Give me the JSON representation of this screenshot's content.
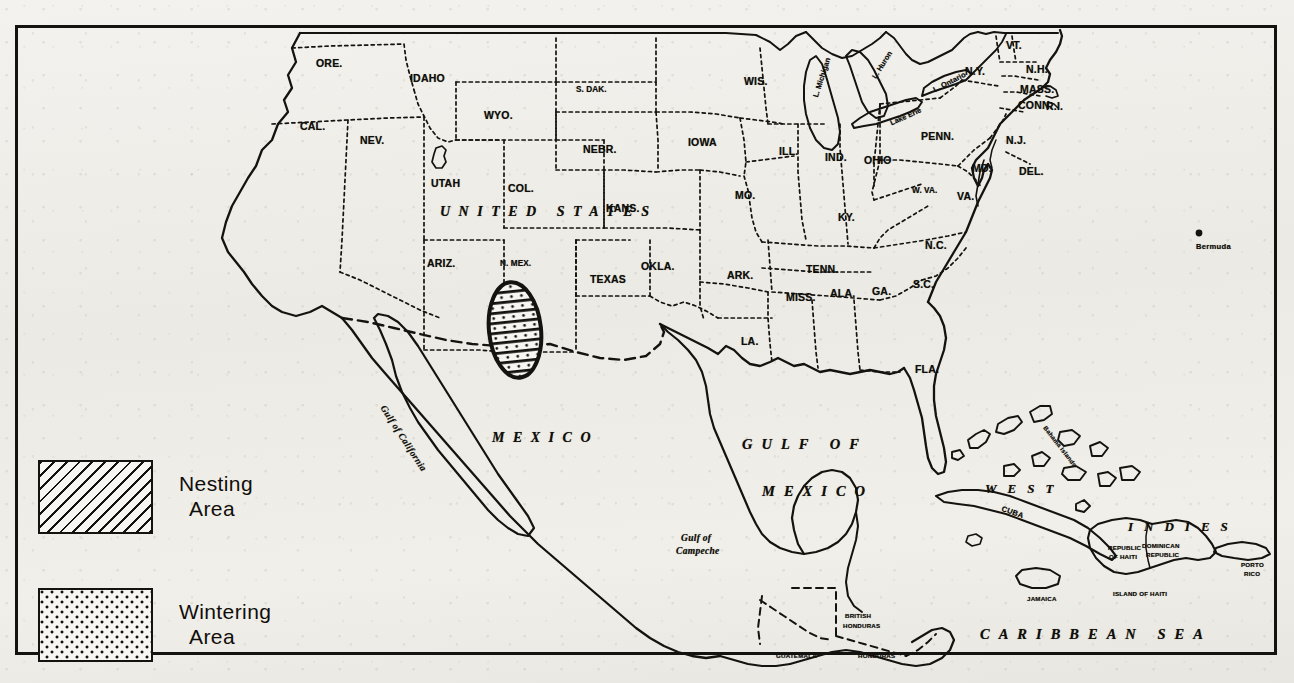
{
  "legend": {
    "items": [
      {
        "label_line1": "Nesting",
        "label_line2": "Area",
        "pattern": "diagonal-hatch"
      },
      {
        "label_line1": "Wintering",
        "label_line2": "Area",
        "pattern": "dot-stipple"
      }
    ]
  },
  "colors": {
    "ink": "#15130f",
    "paper": "#efeeea",
    "frame": "#15130f"
  },
  "regions": {
    "countries": [
      {
        "name": "UNITED STATES",
        "x": 440,
        "y": 205
      },
      {
        "name": "MEXICO",
        "x": 492,
        "y": 431
      }
    ],
    "oceans": [
      {
        "name": "GULF OF",
        "x": 742,
        "y": 437
      },
      {
        "name": "MEXICO",
        "x": 762,
        "y": 484
      },
      {
        "name": "CARIBBEAN SEA",
        "x": 980,
        "y": 627
      }
    ],
    "seas_small": [
      {
        "name": "Gulf of California",
        "x": 386,
        "y": 404
      },
      {
        "name": "Gulf of",
        "x": 681,
        "y": 534
      },
      {
        "name": "Campeche",
        "x": 676,
        "y": 547
      }
    ],
    "west_indies_label": {
      "name": "WEST",
      "x": 985,
      "y": 482
    },
    "indies_label": {
      "name": "INDIES",
      "x": 1128,
      "y": 520
    }
  },
  "states": [
    {
      "abbr": "ORE.",
      "x": 316,
      "y": 58
    },
    {
      "abbr": "IDAHO",
      "x": 410,
      "y": 73
    },
    {
      "abbr": "CAL.",
      "x": 300,
      "y": 121
    },
    {
      "abbr": "NEV.",
      "x": 360,
      "y": 135
    },
    {
      "abbr": "WYO.",
      "x": 484,
      "y": 110
    },
    {
      "abbr": "UTAH",
      "x": 431,
      "y": 178
    },
    {
      "abbr": "COL.",
      "x": 508,
      "y": 183
    },
    {
      "abbr": "S. DAK.",
      "x": 576,
      "y": 86
    },
    {
      "abbr": "NEBR.",
      "x": 583,
      "y": 144
    },
    {
      "abbr": "IOWA",
      "x": 688,
      "y": 137
    },
    {
      "abbr": "KANS.",
      "x": 606,
      "y": 203
    },
    {
      "abbr": "MO.",
      "x": 735,
      "y": 190
    },
    {
      "abbr": "WIS.",
      "x": 744,
      "y": 76
    },
    {
      "abbr": "ILL.",
      "x": 779,
      "y": 146
    },
    {
      "abbr": "IND.",
      "x": 825,
      "y": 152
    },
    {
      "abbr": "OHIO",
      "x": 864,
      "y": 155
    },
    {
      "abbr": "PENN.",
      "x": 921,
      "y": 131
    },
    {
      "abbr": "N.Y.",
      "x": 965,
      "y": 66
    },
    {
      "abbr": "VT.",
      "x": 1006,
      "y": 40
    },
    {
      "abbr": "N.H.",
      "x": 1026,
      "y": 64
    },
    {
      "abbr": "MASS.",
      "x": 1020,
      "y": 84
    },
    {
      "abbr": "CONN.",
      "x": 1018,
      "y": 100
    },
    {
      "abbr": "R.I.",
      "x": 1046,
      "y": 101
    },
    {
      "abbr": "N.J.",
      "x": 1006,
      "y": 135
    },
    {
      "abbr": "DEL.",
      "x": 1019,
      "y": 166
    },
    {
      "abbr": "MD.",
      "x": 972,
      "y": 163
    },
    {
      "abbr": "W. VA.",
      "x": 912,
      "y": 187
    },
    {
      "abbr": "VA.",
      "x": 957,
      "y": 191
    },
    {
      "abbr": "KY.",
      "x": 838,
      "y": 212
    },
    {
      "abbr": "TENN.",
      "x": 806,
      "y": 264
    },
    {
      "abbr": "N.C.",
      "x": 925,
      "y": 240
    },
    {
      "abbr": "S.C.",
      "x": 913,
      "y": 279
    },
    {
      "abbr": "GA.",
      "x": 872,
      "y": 286
    },
    {
      "abbr": "ALA.",
      "x": 830,
      "y": 288
    },
    {
      "abbr": "MISS.",
      "x": 786,
      "y": 292
    },
    {
      "abbr": "ARK.",
      "x": 727,
      "y": 270
    },
    {
      "abbr": "LA.",
      "x": 741,
      "y": 336
    },
    {
      "abbr": "OKLA.",
      "x": 641,
      "y": 261
    },
    {
      "abbr": "TEXAS",
      "x": 590,
      "y": 274
    },
    {
      "abbr": "N. MEX.",
      "x": 500,
      "y": 260
    },
    {
      "abbr": "ARIZ.",
      "x": 427,
      "y": 258
    },
    {
      "abbr": "FLA.",
      "x": 915,
      "y": 364
    }
  ],
  "lakes": [
    {
      "name": "L. Michigan",
      "x": 812,
      "y": 96,
      "rotate": -72
    },
    {
      "name": "L. Huron",
      "x": 871,
      "y": 76,
      "rotate": -58
    },
    {
      "name": "Lake Erie",
      "x": 889,
      "y": 120,
      "rotate": -24
    },
    {
      "name": "L. Ontario",
      "x": 932,
      "y": 87,
      "rotate": -27
    }
  ],
  "islands": [
    {
      "name": "Bermuda",
      "x": 1196,
      "y": 243,
      "cls": "isl"
    },
    {
      "name": "Bahama Islands",
      "x": 1047,
      "y": 425,
      "cls": "isl-xs",
      "rotate": 52
    },
    {
      "name": "CUBA",
      "x": 1003,
      "y": 505,
      "cls": "isl",
      "rotate": 20
    },
    {
      "name": "JAMAICA",
      "x": 1027,
      "y": 596,
      "cls": "isl-xs"
    },
    {
      "name": "REPUBLIC",
      "x": 1108,
      "y": 545,
      "cls": "isl-xs"
    },
    {
      "name": "OF HAITI",
      "x": 1109,
      "y": 554,
      "cls": "isl-xs"
    },
    {
      "name": "DOMINICAN",
      "x": 1142,
      "y": 543,
      "cls": "isl-xs"
    },
    {
      "name": "REPUBLIC",
      "x": 1146,
      "y": 552,
      "cls": "isl-xs"
    },
    {
      "name": "ISLAND OF HAITI",
      "x": 1113,
      "y": 591,
      "cls": "isl-xs"
    },
    {
      "name": "PORTO",
      "x": 1241,
      "y": 562,
      "cls": "isl-xs"
    },
    {
      "name": "RICO",
      "x": 1244,
      "y": 571,
      "cls": "isl-xs"
    }
  ],
  "central_america": [
    {
      "name": "BRITISH",
      "x": 845,
      "y": 613,
      "cls": "isl-xs"
    },
    {
      "name": "HONDURAS",
      "x": 843,
      "y": 623,
      "cls": "isl-xs"
    },
    {
      "name": "GUATEMALA",
      "x": 776,
      "y": 653,
      "cls": "isl-xs"
    },
    {
      "name": "HONDURAS",
      "x": 858,
      "y": 653,
      "cls": "isl-xs"
    }
  ],
  "marked_area": {
    "description": "Nesting and wintering area, southern New Mexico into northern Mexico",
    "patterns": [
      "diagonal-hatch",
      "dot-stipple"
    ],
    "center_x": 515,
    "center_y": 330
  }
}
